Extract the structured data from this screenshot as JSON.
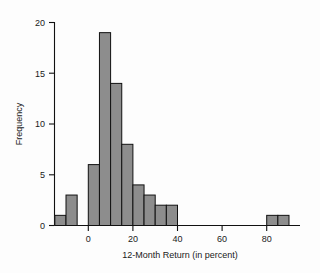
{
  "chart_data": {
    "type": "bar",
    "title": "",
    "xlabel": "12-Month Return (in percent)",
    "ylabel": "Frequency",
    "bin_width": 5,
    "bin_starts": [
      -15,
      -10,
      -5,
      0,
      5,
      10,
      15,
      20,
      25,
      30,
      35,
      40,
      45,
      50,
      55,
      60,
      65,
      70,
      75,
      80,
      85
    ],
    "categories": [
      "-15 to -10",
      "-10 to -5",
      "-5 to 0",
      "0 to 5",
      "5 to 10",
      "10 to 15",
      "15 to 20",
      "20 to 25",
      "25 to 30",
      "30 to 35",
      "35 to 40",
      "40 to 45",
      "45 to 50",
      "50 to 55",
      "55 to 60",
      "60 to 65",
      "65 to 70",
      "70 to 75",
      "75 to 80",
      "80 to 85",
      "85 to 90"
    ],
    "values": [
      1,
      3,
      0,
      6,
      19,
      14,
      8,
      4,
      3,
      2,
      2,
      0,
      0,
      0,
      0,
      0,
      0,
      0,
      0,
      1,
      1
    ],
    "xlim": [
      -17,
      95
    ],
    "ylim": [
      0,
      20.5
    ],
    "xticks": [
      0,
      20,
      40,
      60,
      80
    ],
    "xtick_labels": [
      "0",
      "20",
      "40",
      "60",
      "80"
    ],
    "yticks": [
      0,
      5,
      10,
      15,
      20
    ],
    "ytick_labels": [
      "0",
      "5",
      "10",
      "15",
      "20"
    ],
    "grid": false,
    "legend": "none",
    "bar_fill_color": "#8d8d8d",
    "bar_edge_color": "#111111",
    "axis_color": "#111111",
    "background_color": "#fdfdfd"
  },
  "axes": {
    "x_axis_title": "12-Month Return (in percent)",
    "y_axis_title": "Frequency"
  }
}
